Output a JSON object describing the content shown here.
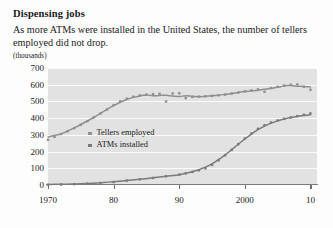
{
  "chart_data": {
    "type": "scatter",
    "title": "Dispensing jobs",
    "subtitle": "As more ATMs were installed in the United States, the number of tellers employed did not drop.",
    "units": "(thousands)",
    "xlabel": "",
    "ylabel": "",
    "ylim": [
      0,
      700
    ],
    "xlim": [
      1970,
      2011
    ],
    "yticks": [
      700,
      600,
      500,
      400,
      300,
      200,
      100,
      0
    ],
    "xticks": [
      1970,
      1980,
      1990,
      2000,
      2010
    ],
    "xtick_labels": [
      "1970",
      "80",
      "90",
      "2000",
      "10"
    ],
    "grid": true,
    "legend_position": "center-left",
    "colors": {
      "tellers": "#8f8f8f",
      "atms": "#7a7a7a",
      "plot_background": "#e2e2e2",
      "gridline": "#fbfbfb",
      "axis": "#7c7c7c"
    },
    "series": [
      {
        "name": "Tellers employed",
        "marker": "square",
        "x": [
          1970,
          1971,
          1972,
          1973,
          1974,
          1975,
          1976,
          1977,
          1978,
          1979,
          1980,
          1981,
          1982,
          1983,
          1984,
          1985,
          1986,
          1987,
          1988,
          1989,
          1990,
          1991,
          1992,
          1993,
          1994,
          1995,
          1996,
          1997,
          1998,
          1999,
          2000,
          2001,
          2002,
          2003,
          2004,
          2005,
          2006,
          2007,
          2008,
          2009,
          2010
        ],
        "values": [
          270,
          288,
          305,
          322,
          340,
          360,
          382,
          405,
          428,
          452,
          478,
          500,
          516,
          528,
          536,
          541,
          544,
          546,
          500,
          548,
          549,
          520,
          527,
          529,
          530,
          533,
          537,
          541,
          547,
          553,
          560,
          566,
          572,
          558,
          580,
          588,
          595,
          600,
          602,
          588,
          570
        ]
      },
      {
        "name": "ATMs installed",
        "marker": "square",
        "x": [
          1970,
          1972,
          1974,
          1976,
          1978,
          1980,
          1982,
          1984,
          1986,
          1988,
          1990,
          1991,
          1992,
          1993,
          1994,
          1995,
          1996,
          1997,
          1998,
          1999,
          2000,
          2001,
          2002,
          2003,
          2004,
          2005,
          2006,
          2007,
          2008,
          2009,
          2010
        ],
        "values": [
          2,
          3,
          5,
          8,
          12,
          18,
          26,
          34,
          42,
          52,
          62,
          70,
          78,
          88,
          100,
          120,
          148,
          178,
          210,
          244,
          278,
          308,
          336,
          358,
          374,
          386,
          396,
          404,
          412,
          420,
          428
        ]
      }
    ]
  }
}
